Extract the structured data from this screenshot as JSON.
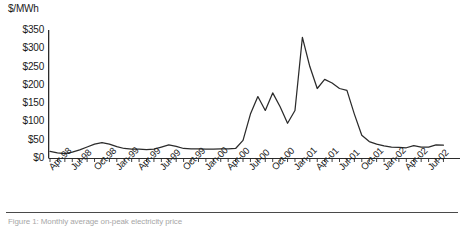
{
  "chart_data": {
    "type": "line",
    "title": "",
    "subtitle": "",
    "xlabel": "",
    "ylabel": "$/MWh",
    "ylim": [
      0,
      350
    ],
    "xlim": [
      "Apr-98",
      "Sep-02"
    ],
    "grid": false,
    "legend": null,
    "y_ticks": [
      0,
      50,
      100,
      150,
      200,
      250,
      300,
      350
    ],
    "y_tick_labels": [
      "$0",
      "$50",
      "$100",
      "$150",
      "$200",
      "$250",
      "$300",
      "$350"
    ],
    "x_tick_labels": [
      "Apr-98",
      "Jul-98",
      "Oct-98",
      "Jan-99",
      "Apr-99",
      "Jul-99",
      "Oct-99",
      "Jan-00",
      "Apr-00",
      "Jul-00",
      "Oct-00",
      "Jan-01",
      "Apr-01",
      "Jul-01",
      "Oct-01",
      "Jan-02",
      "Apr-02",
      "Jul-02"
    ],
    "x": [
      "Apr-98",
      "May-98",
      "Jun-98",
      "Jul-98",
      "Aug-98",
      "Sep-98",
      "Oct-98",
      "Nov-98",
      "Dec-98",
      "Jan-99",
      "Feb-99",
      "Mar-99",
      "Apr-99",
      "May-99",
      "Jun-99",
      "Jul-99",
      "Aug-99",
      "Sep-99",
      "Oct-99",
      "Nov-99",
      "Dec-99",
      "Jan-00",
      "Feb-00",
      "Mar-00",
      "Apr-00",
      "May-00",
      "Jun-00",
      "Jul-00",
      "Aug-00",
      "Sep-00",
      "Oct-00",
      "Nov-00",
      "Dec-00",
      "Jan-01",
      "Feb-01",
      "Mar-01",
      "Apr-01",
      "May-01",
      "Jun-01",
      "Jul-01",
      "Aug-01",
      "Sep-01",
      "Oct-01",
      "Nov-01",
      "Dec-01",
      "Jan-02",
      "Feb-02",
      "Mar-02",
      "Apr-02",
      "May-02",
      "Jun-02",
      "Jul-02",
      "Aug-02",
      "Sep-02"
    ],
    "values": [
      18,
      14,
      12,
      16,
      22,
      30,
      38,
      42,
      38,
      31,
      26,
      24,
      24,
      23,
      24,
      30,
      36,
      32,
      26,
      25,
      25,
      24,
      24,
      25,
      25,
      26,
      48,
      120,
      168,
      130,
      178,
      140,
      95,
      130,
      330,
      250,
      190,
      215,
      205,
      190,
      185,
      120,
      62,
      45,
      38,
      33,
      30,
      29,
      28,
      34,
      30,
      30,
      36,
      35
    ]
  },
  "caption": {
    "text": "Figure 1: Monthly average on-peak electricity price"
  }
}
